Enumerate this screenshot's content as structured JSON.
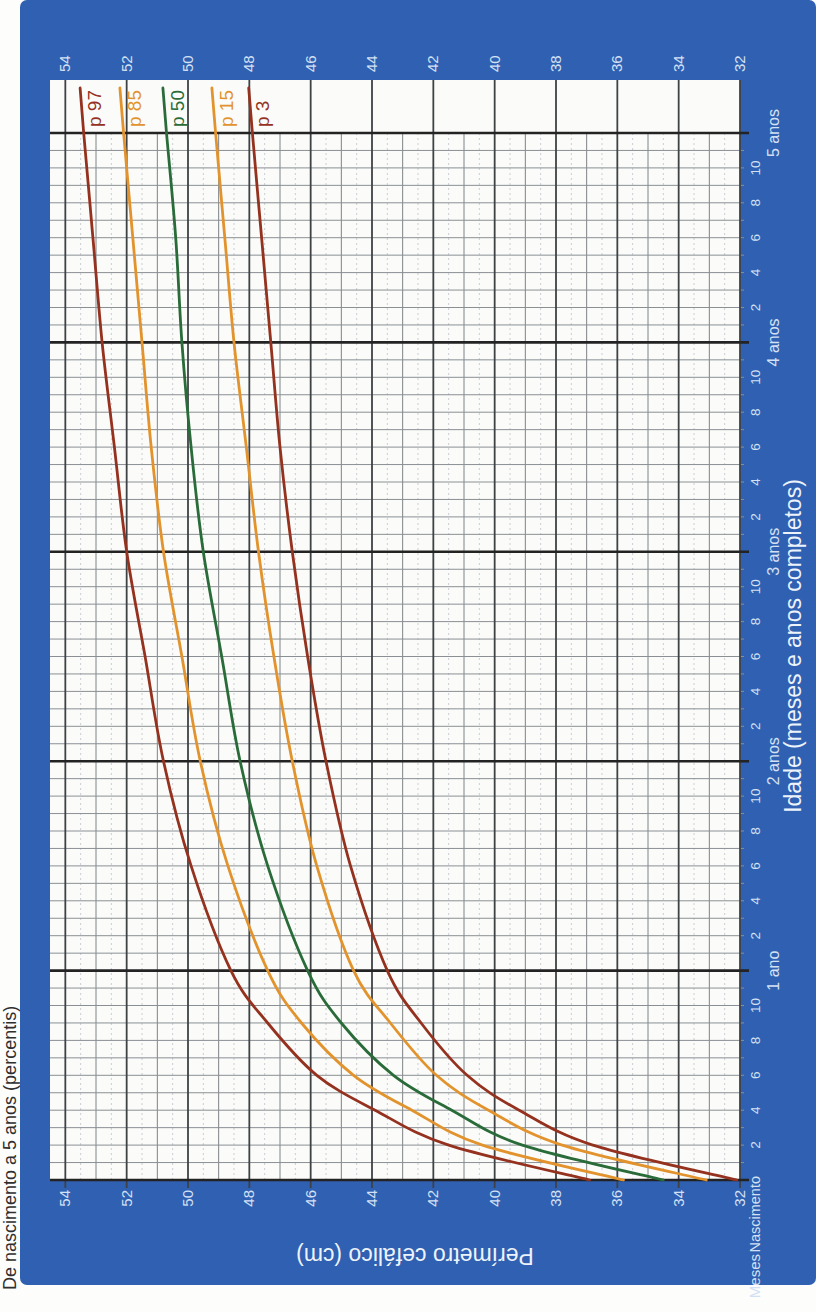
{
  "colors": {
    "frame_blue": "#2f60b1",
    "plot_white": "#fbfcf9",
    "label_light": "#d4e1f4",
    "title_white": "#edf3fb",
    "title_dark": "#2f2f2f",
    "maroon": "#94321f",
    "orange": "#e2932d",
    "green": "#2a6b3a",
    "grid_half": "#c9cdd3",
    "grid_minor": "#7e8286",
    "grid_month": "#8a8f94",
    "grid_major": "#3f4245",
    "grid_year": "#232323"
  },
  "chart_data": {
    "type": "line",
    "title": "De nascimento a 5 anos (percentis)",
    "xlabel": "Idade (meses e anos completos)",
    "ylabel": "Perímetro cefálico (cm)",
    "birth_label": "Nascimento",
    "months_unit": "Meses",
    "grid": "on",
    "xlim_months": [
      0,
      60
    ],
    "ylim": [
      32,
      54.5
    ],
    "y_tick_labels": [
      "54",
      "52",
      "50",
      "48",
      "46",
      "44",
      "42",
      "40",
      "38",
      "36",
      "34",
      "32"
    ],
    "month_numbers_labeled": [
      2,
      4,
      6,
      8,
      10
    ],
    "year_labels": [
      "1 ano",
      "2 anos",
      "3 anos",
      "4 anos",
      "5 anos"
    ],
    "x_months": [
      0,
      2,
      4,
      6,
      9,
      12,
      18,
      24,
      30,
      36,
      42,
      48,
      54,
      60
    ],
    "series": [
      {
        "name": "p 97",
        "color_key": "maroon",
        "values": [
          36.9,
          41.5,
          43.9,
          45.8,
          47.4,
          48.6,
          49.9,
          50.8,
          51.4,
          52.0,
          52.4,
          52.8,
          53.1,
          53.4
        ]
      },
      {
        "name": "p 85",
        "color_key": "orange",
        "values": [
          35.8,
          40.4,
          42.7,
          44.6,
          46.3,
          47.4,
          48.7,
          49.6,
          50.2,
          50.8,
          51.2,
          51.5,
          51.8,
          52.1
        ]
      },
      {
        "name": "p 50",
        "color_key": "green",
        "values": [
          34.5,
          39.1,
          41.4,
          43.3,
          45.0,
          46.1,
          47.4,
          48.3,
          48.9,
          49.5,
          49.9,
          50.2,
          50.4,
          50.7
        ]
      },
      {
        "name": "p 15",
        "color_key": "orange",
        "values": [
          33.1,
          37.8,
          40.2,
          41.9,
          43.4,
          44.6,
          45.8,
          46.6,
          47.2,
          47.7,
          48.1,
          48.5,
          48.8,
          49.1
        ]
      },
      {
        "name": "p 3",
        "color_key": "maroon",
        "values": [
          32.1,
          36.8,
          39.2,
          40.9,
          42.4,
          43.5,
          44.7,
          45.5,
          46.1,
          46.6,
          47.0,
          47.3,
          47.6,
          47.9
        ]
      }
    ],
    "legend_position": "right-of-curves"
  }
}
